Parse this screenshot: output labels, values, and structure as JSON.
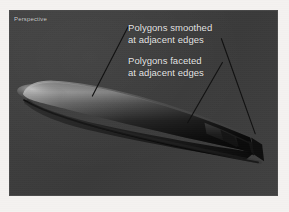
{
  "viewport": {
    "label": "Perspective",
    "background_color": "#3d3d3d",
    "border_color": "#4a4a4a"
  },
  "page": {
    "background_color": "#f4f2f0"
  },
  "annotations": [
    {
      "id": "smoothed",
      "text": "Polygons smoothed\nat adjacent edges",
      "color": "#e8e8e8"
    },
    {
      "id": "faceted",
      "text": "Polygons faceted\nat adjacent edges",
      "color": "#e8e8e8"
    }
  ],
  "leader_lines": [
    {
      "id": "smoothed-leader",
      "x1": 128,
      "y1": 26,
      "x2": 92,
      "y2": 96
    },
    {
      "id": "faceted-leader-left",
      "x1": 223,
      "y1": 62,
      "x2": 188,
      "y2": 123
    },
    {
      "id": "faceted-leader-right",
      "x1": 222,
      "y1": 38,
      "x2": 256,
      "y2": 134
    }
  ],
  "model": {
    "name": "smooth-shaded-hull",
    "shading_note": "smooth gouraud body with faceted right-hand band",
    "highlight_color": "#8e8e8e",
    "body_dark_color": "#141414",
    "facet_color": "#101010"
  }
}
